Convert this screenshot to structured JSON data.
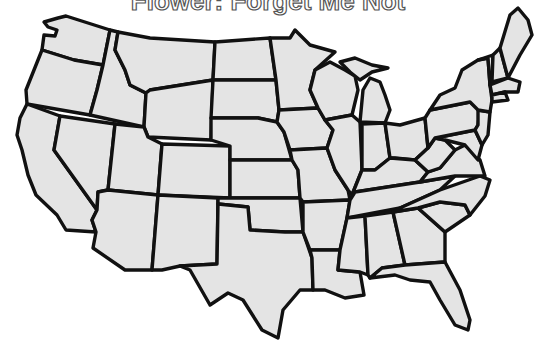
{
  "title": "Flower: Forget Me Not",
  "map": {
    "subject": "United States (contiguous 48 states) outline coloring page",
    "fill_color": "#e4e4e4",
    "border_color": "#111111",
    "background_color": "#ffffff",
    "states": [
      "Washington",
      "Oregon",
      "California",
      "Idaho",
      "Nevada",
      "Montana",
      "Wyoming",
      "Utah",
      "Arizona",
      "Colorado",
      "New Mexico",
      "North Dakota",
      "South Dakota",
      "Nebraska",
      "Kansas",
      "Oklahoma",
      "Texas",
      "Minnesota",
      "Iowa",
      "Missouri",
      "Arkansas",
      "Louisiana",
      "Wisconsin",
      "Illinois",
      "Michigan",
      "Indiana",
      "Ohio",
      "Kentucky",
      "Tennessee",
      "Mississippi",
      "Alabama",
      "Georgia",
      "Florida",
      "South Carolina",
      "North Carolina",
      "Virginia",
      "West Virginia",
      "Maryland",
      "Delaware",
      "Pennsylvania",
      "New Jersey",
      "New York",
      "Connecticut",
      "Rhode Island",
      "Massachusetts",
      "Vermont",
      "New Hampshire",
      "Maine"
    ]
  }
}
